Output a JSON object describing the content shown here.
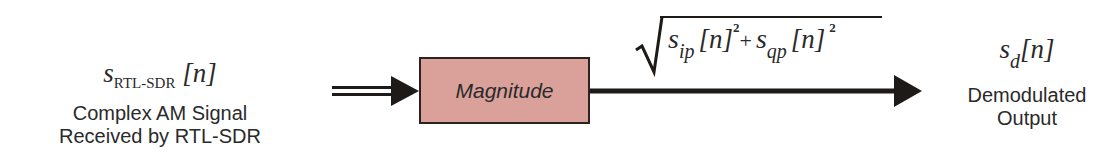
{
  "diagram": {
    "input": {
      "symbol": "s",
      "subscript": "RTL-SDR",
      "index": "[n]",
      "caption_line1": "Complex AM Signal",
      "caption_line2": "Received by RTL-SDR"
    },
    "block": {
      "label": "Magnitude",
      "fill_color": "#d9a19a",
      "border_color": "#2b2320"
    },
    "formula": {
      "radical": "√",
      "term1_symbol": "s",
      "term1_subscript": "ip",
      "term1_index": "[n]",
      "term1_power": "2",
      "plus": "+",
      "term2_symbol": "s",
      "term2_subscript": "qp",
      "term2_index": "[n]",
      "term2_power": "2"
    },
    "output": {
      "symbol": "s",
      "subscript": "d",
      "index": "[n]",
      "caption_line1": "Demodulated",
      "caption_line2": "Output"
    },
    "connections": [
      {
        "from": "input",
        "to": "block",
        "style": "double-line-arrow"
      },
      {
        "from": "block",
        "to": "output",
        "style": "single-line-arrow"
      }
    ]
  }
}
